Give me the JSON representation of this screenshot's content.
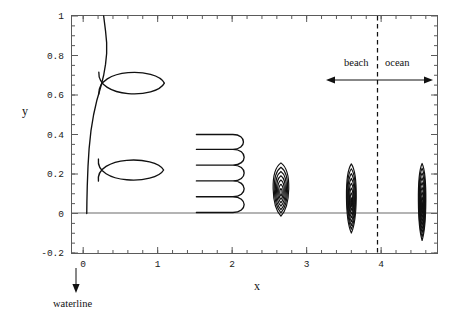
{
  "figure": {
    "axis_labels": {
      "x": "x",
      "y": "y"
    },
    "annotations": {
      "waterline": "waterline",
      "beach": "beach",
      "ocean": "ocean"
    }
  },
  "chart_data": {
    "type": "line",
    "title": "",
    "xlabel": "x",
    "ylabel": "y",
    "xlim": [
      -0.15,
      4.75
    ],
    "ylim": [
      -0.2,
      1.0
    ],
    "grid": false,
    "legend": "none",
    "x_ticks": [
      0,
      1,
      2,
      3,
      4
    ],
    "x_tick_labels": [
      "0",
      "1",
      "2",
      "3",
      "4"
    ],
    "x_minor_tick_step": 0.2,
    "y_ticks": [
      -0.2,
      0,
      0.2,
      0.4,
      0.6,
      0.8,
      1
    ],
    "y_tick_labels": [
      "-0.2",
      "0",
      "0.2",
      "0.4",
      "0.6",
      "0.8",
      "1"
    ],
    "y_minor_tick_step": 0.05,
    "zero_line_y": 0,
    "waterline_x": 0,
    "shore_boundary_x": 4.0,
    "annotation_arrow": {
      "x_start": 3.35,
      "x_end": 4.62,
      "y": 0.74
    },
    "annotation_text_y": 0.82,
    "series": [
      {
        "name": "asymptotic-waterline-curve",
        "comment": "steep curve hugging x=0 rising to y=1",
        "points_xy": [
          [
            0.048,
            0.0
          ],
          [
            0.05,
            0.06
          ],
          [
            0.055,
            0.14
          ],
          [
            0.065,
            0.24
          ],
          [
            0.08,
            0.33
          ],
          [
            0.105,
            0.42
          ],
          [
            0.14,
            0.5
          ],
          [
            0.185,
            0.575
          ],
          [
            0.235,
            0.64
          ],
          [
            0.275,
            0.7
          ],
          [
            0.3,
            0.755
          ],
          [
            0.315,
            0.81
          ],
          [
            0.315,
            0.865
          ],
          [
            0.3,
            0.925
          ],
          [
            0.275,
            1.0
          ]
        ]
      },
      {
        "name": "loop-lower",
        "comment": "large open loop centred near (0.62, 0.22)",
        "center": [
          0.62,
          0.22
        ],
        "half_width": 0.46,
        "half_height": 0.075,
        "crossing_x": 0.205
      },
      {
        "name": "loop-upper",
        "comment": "large open loop centred near (0.64, 0.66)",
        "center": [
          0.64,
          0.66
        ],
        "half_width": 0.45,
        "half_height": 0.08,
        "crossing_x": 0.21
      },
      {
        "name": "meander-cluster",
        "comment": "serpentine comb between x=1.52 and x=2.03",
        "x_left": 1.52,
        "x_right": 2.01,
        "y_levels": [
          0.4,
          0.325,
          0.245,
          0.165,
          0.085,
          0.005
        ],
        "turns": 5
      },
      {
        "name": "nested-loops-1",
        "comment": "stack of nested loops at x 2.65",
        "center_x": 2.655,
        "center_y": 0.105,
        "loop_count": 7,
        "max_half_width": 0.115,
        "max_half_height": 0.135
      },
      {
        "name": "nested-loops-2",
        "comment": "stack of nested loops at x 3.6",
        "center_x": 3.6,
        "center_y": 0.055,
        "loop_count": 8,
        "max_half_width": 0.072,
        "max_half_height": 0.175
      },
      {
        "name": "nested-loops-3",
        "comment": "stack of nested loops at x 4.55",
        "center_x": 4.55,
        "center_y": 0.035,
        "loop_count": 9,
        "max_half_width": 0.055,
        "max_half_height": 0.195
      }
    ]
  }
}
